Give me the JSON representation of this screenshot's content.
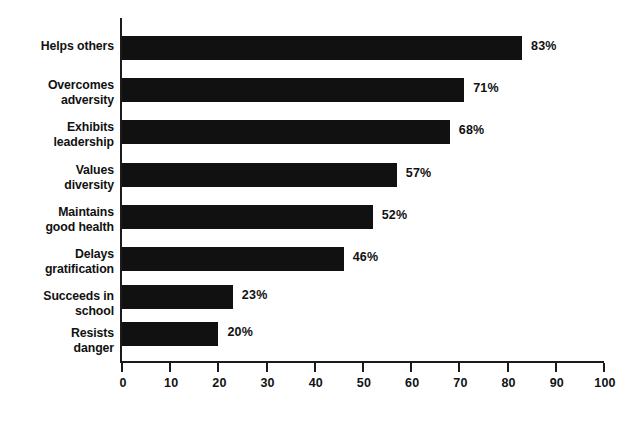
{
  "chart_data": {
    "type": "bar",
    "orientation": "horizontal",
    "title": "",
    "subtitle": "",
    "xlabel": "",
    "ylabel": "",
    "categories": [
      "Helps others",
      "Overcomes adversity",
      "Exhibits leadership",
      "Values diversity",
      "Maintains good health",
      "Delays gratification",
      "Succeeds in school",
      "Resists danger"
    ],
    "category_lines": [
      [
        "Helps others"
      ],
      [
        "Overcomes",
        "adversity"
      ],
      [
        "Exhibits",
        "leadership"
      ],
      [
        "Values",
        "diversity"
      ],
      [
        "Maintains",
        "good health"
      ],
      [
        "Delays",
        "gratification"
      ],
      [
        "Succeeds in",
        "school"
      ],
      [
        "Resists",
        "danger"
      ]
    ],
    "values": [
      83,
      71,
      68,
      57,
      52,
      46,
      23,
      20
    ],
    "value_labels": [
      "83%",
      "71%",
      "68%",
      "57%",
      "52%",
      "46%",
      "23%",
      "20%"
    ],
    "xlim": [
      0,
      100
    ],
    "xticks": [
      0,
      10,
      20,
      30,
      40,
      50,
      60,
      70,
      80,
      90,
      100
    ],
    "xtick_labels": [
      "0",
      "10",
      "20",
      "30",
      "40",
      "50",
      "60",
      "70",
      "80",
      "90",
      "100"
    ],
    "grid": false,
    "legend": null,
    "bar_color": "#111111",
    "axis_color": "#1b1b1b",
    "text_color": "#111111",
    "background_color": "#ffffff"
  }
}
